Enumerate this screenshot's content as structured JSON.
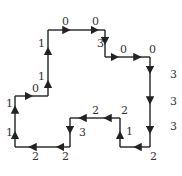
{
  "diagram": {
    "type": "freeman-chain-code",
    "nodes": [
      [
        15,
        147
      ],
      [
        15,
        118
      ],
      [
        15,
        96
      ],
      [
        48,
        96
      ],
      [
        48,
        67
      ],
      [
        48,
        57
      ],
      [
        48,
        30
      ],
      [
        90,
        30
      ],
      [
        105,
        30
      ],
      [
        105,
        57
      ],
      [
        130,
        57
      ],
      [
        150,
        57
      ],
      [
        150,
        88
      ],
      [
        150,
        118
      ],
      [
        150,
        147
      ],
      [
        120,
        147
      ],
      [
        120,
        118
      ],
      [
        105,
        118
      ],
      [
        90,
        118
      ],
      [
        70,
        118
      ],
      [
        70,
        147
      ],
      [
        45,
        147
      ],
      [
        15,
        147
      ]
    ],
    "edges": [
      {
        "from": [
          15,
          147
        ],
        "to": [
          15,
          118
        ],
        "label": "1",
        "lx": 6,
        "ly": 136
      },
      {
        "from": [
          15,
          118
        ],
        "to": [
          15,
          96
        ],
        "label": "1",
        "lx": 6,
        "ly": 107
      },
      {
        "from": [
          15,
          96
        ],
        "to": [
          48,
          96
        ],
        "label": "0",
        "lx": 32,
        "ly": 92
      },
      {
        "from": [
          48,
          96
        ],
        "to": [
          48,
          67
        ],
        "label": "1",
        "lx": 38,
        "ly": 80
      },
      {
        "from": [
          48,
          67
        ],
        "to": [
          48,
          30
        ],
        "label": "1",
        "lx": 38,
        "ly": 47
      },
      {
        "from": [
          48,
          30
        ],
        "to": [
          90,
          30
        ],
        "label": "0",
        "lx": 62,
        "ly": 25
      },
      {
        "from": [
          90,
          30
        ],
        "to": [
          105,
          30
        ],
        "label": "0",
        "lx": 92,
        "ly": 25
      },
      {
        "from": [
          105,
          30
        ],
        "to": [
          105,
          57
        ],
        "label": "3",
        "lx": 97,
        "ly": 47
      },
      {
        "from": [
          105,
          57
        ],
        "to": [
          130,
          57
        ],
        "label": "0",
        "lx": 120,
        "ly": 53
      },
      {
        "from": [
          130,
          57
        ],
        "to": [
          150,
          57
        ],
        "label": "0",
        "lx": 149,
        "ly": 53
      },
      {
        "from": [
          150,
          57
        ],
        "to": [
          150,
          88
        ],
        "label": "3",
        "lx": 170,
        "ly": 78
      },
      {
        "from": [
          150,
          88
        ],
        "to": [
          150,
          118
        ],
        "label": "3",
        "lx": 170,
        "ly": 105
      },
      {
        "from": [
          150,
          118
        ],
        "to": [
          150,
          147
        ],
        "label": "3",
        "lx": 170,
        "ly": 130
      },
      {
        "from": [
          150,
          147
        ],
        "to": [
          120,
          147
        ],
        "label": "2",
        "lx": 150,
        "ly": 160
      },
      {
        "from": [
          120,
          147
        ],
        "to": [
          120,
          118
        ],
        "label": "1",
        "lx": 126,
        "ly": 135
      },
      {
        "from": [
          120,
          118
        ],
        "to": [
          90,
          118
        ],
        "label": "2",
        "lx": 121,
        "ly": 114
      },
      {
        "from": [
          90,
          118
        ],
        "to": [
          70,
          118
        ],
        "label": "2",
        "lx": 92,
        "ly": 114
      },
      {
        "from": [
          70,
          118
        ],
        "to": [
          70,
          147
        ],
        "label": "3",
        "lx": 79,
        "ly": 136
      },
      {
        "from": [
          70,
          147
        ],
        "to": [
          45,
          147
        ],
        "label": "2",
        "lx": 62,
        "ly": 160
      },
      {
        "from": [
          45,
          147
        ],
        "to": [
          15,
          147
        ],
        "label": "2",
        "lx": 32,
        "ly": 160
      }
    ]
  }
}
